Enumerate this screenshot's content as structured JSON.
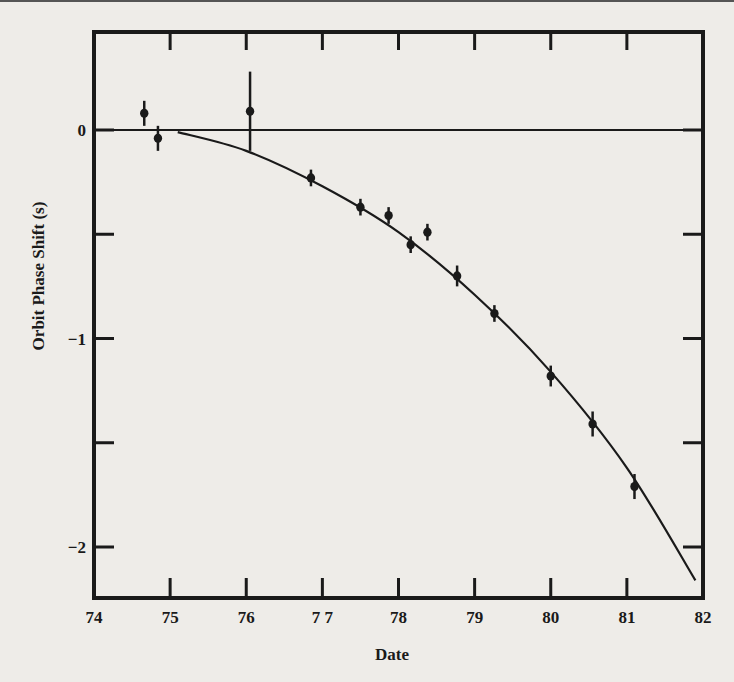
{
  "chart_data": {
    "type": "scatter",
    "title": "",
    "xlabel": "Date",
    "ylabel": "Orbit Phase Shift (s)",
    "xlim": [
      74,
      82
    ],
    "ylim": [
      -2.25,
      0.47
    ],
    "x_ticks": [
      74,
      75,
      76,
      77,
      78,
      79,
      80,
      81,
      82
    ],
    "x_tick_labels": [
      "74",
      "75",
      "76",
      "7 7",
      "78",
      "79",
      "80",
      "81",
      "82"
    ],
    "y_ticks_labeled": [
      0,
      -1,
      -2
    ],
    "y_tick_labels": [
      "0",
      "−1",
      "−2"
    ],
    "y_minor_ticks": [
      -0.5,
      -1.5
    ],
    "grid": false,
    "legend": null,
    "reference_line": {
      "y": 0
    },
    "series": [
      {
        "name": "observed",
        "style": "points-with-error-bars",
        "points": [
          {
            "x": 74.66,
            "y": 0.08,
            "err": 0.06
          },
          {
            "x": 74.84,
            "y": -0.04,
            "err": 0.06
          },
          {
            "x": 76.05,
            "y": 0.09,
            "err": 0.19
          },
          {
            "x": 76.85,
            "y": -0.23,
            "err": 0.04
          },
          {
            "x": 77.5,
            "y": -0.37,
            "err": 0.04
          },
          {
            "x": 77.87,
            "y": -0.41,
            "err": 0.04
          },
          {
            "x": 78.16,
            "y": -0.55,
            "err": 0.04
          },
          {
            "x": 78.38,
            "y": -0.49,
            "err": 0.04
          },
          {
            "x": 78.77,
            "y": -0.7,
            "err": 0.05
          },
          {
            "x": 79.26,
            "y": -0.88,
            "err": 0.04
          },
          {
            "x": 80.0,
            "y": -1.18,
            "err": 0.05
          },
          {
            "x": 80.55,
            "y": -1.41,
            "err": 0.06
          },
          {
            "x": 81.1,
            "y": -1.71,
            "err": 0.06
          }
        ]
      },
      {
        "name": "predicted (general relativity)",
        "style": "curve",
        "points": [
          {
            "x": 75.1,
            "y": -0.01
          },
          {
            "x": 76.0,
            "y": -0.1
          },
          {
            "x": 77.0,
            "y": -0.27
          },
          {
            "x": 78.0,
            "y": -0.49
          },
          {
            "x": 79.0,
            "y": -0.79
          },
          {
            "x": 80.0,
            "y": -1.16
          },
          {
            "x": 81.0,
            "y": -1.62
          },
          {
            "x": 81.9,
            "y": -2.16
          }
        ]
      }
    ]
  }
}
